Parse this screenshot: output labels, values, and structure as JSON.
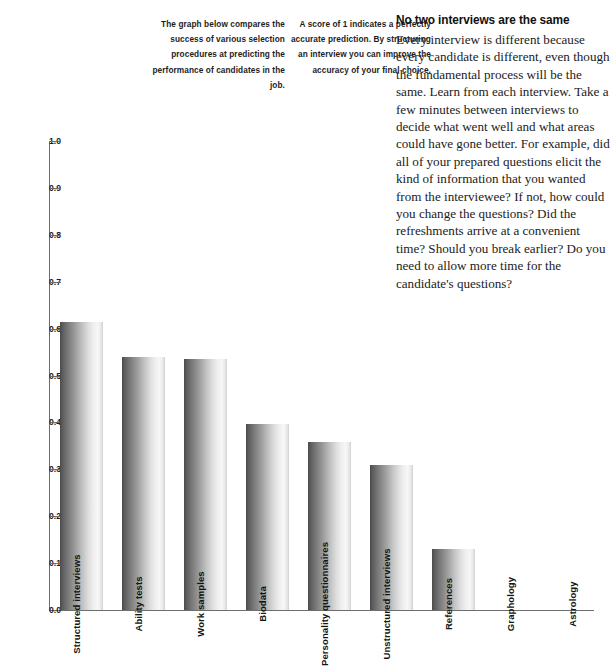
{
  "sidenotes": [
    "The graph below compares the success of various selection procedures at predicting the performance of candidates in the job.",
    "A score of 1 indicates a perfectly accurate prediction. By structuring an interview you can improve the accuracy of your final choice."
  ],
  "article": {
    "heading": "No two interviews are the same",
    "body": "Every interview is different because every candidate is different, even though the fundamental process will be the same. Learn from each interview. Take a few minutes between interviews to decide what went well and what areas could have gone better. For example, did all of your prepared questions elicit the kind of information that you wanted from the interviewee? If not, how could you change the questions? Did the refreshments arrive at a convenient time? Should you break earlier? Do you need to allow more time for the candidate's questions?"
  },
  "chart_data": {
    "type": "bar",
    "title": "",
    "xlabel": "",
    "ylabel": "",
    "ylim": [
      0.0,
      1.0
    ],
    "grid": false,
    "legend": "none",
    "ytick_labels": [
      "1.0",
      "0.9",
      "0.8",
      "0.7",
      "0.6",
      "0.5",
      "0.4",
      "0.3",
      "0.2",
      "0.1",
      "0.0"
    ],
    "ytick_values": [
      1.0,
      0.9,
      0.8,
      0.7,
      0.6,
      0.5,
      0.4,
      0.3,
      0.2,
      0.1,
      0.0
    ],
    "categories": [
      "Structured interviews",
      "Ability tests",
      "Work samples",
      "Biodata",
      "Personality questionnaires",
      "Unstructured interviews",
      "References",
      "Graphology",
      "Astrology"
    ],
    "values": [
      0.615,
      0.54,
      0.535,
      0.397,
      0.358,
      0.31,
      0.13,
      0.0,
      0.0
    ]
  },
  "colors": {
    "bar_dark": "#4a4a4a",
    "bar_light": "#f7f7f7",
    "axis": "#6d6d6d",
    "text": "#1a1a1a",
    "background": "#ffffff"
  }
}
